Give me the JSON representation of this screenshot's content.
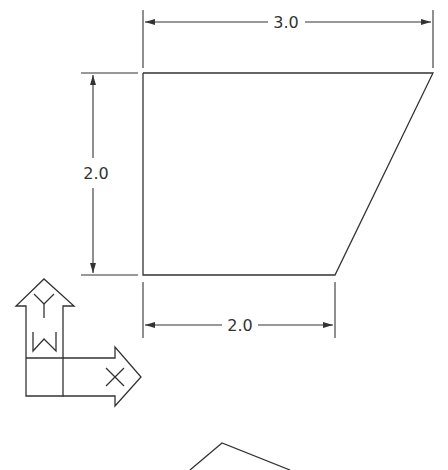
{
  "drawing": {
    "dimensions": {
      "top_width": "3.0",
      "left_height": "2.0",
      "bottom_width": "2.0"
    },
    "ucs_icon": {
      "y_label": "Y",
      "w_label": "W",
      "x_label": "X"
    },
    "colors": {
      "line": "#333333",
      "background": "#ffffff"
    }
  }
}
